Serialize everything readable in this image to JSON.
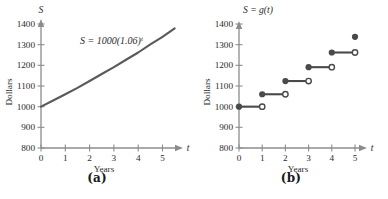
{
  "figure": {
    "background": "#ffffff",
    "axis_color": "#8c8c8c",
    "curve_color": "#5a5a5a",
    "text_color": "#2b2b2b"
  },
  "panels": [
    {
      "key": "a",
      "sub_label": "(a)",
      "title": "S",
      "equation_label": "S = 1000(1.06)",
      "equation_exponent": "t",
      "y_axis_label": "Dollars",
      "x_axis_label": "Years",
      "x_axis_symbol": "t",
      "y_ticks": [
        "800",
        "900",
        "1000",
        "1100",
        "1200",
        "1300",
        "1400"
      ],
      "x_ticks": [
        "0",
        "1",
        "2",
        "3",
        "4",
        "5"
      ]
    },
    {
      "key": "b",
      "sub_label": "(b)",
      "title": "S = g(t)",
      "title_plain": "S = ",
      "title_func": "g",
      "title_arg": "(t)",
      "y_axis_label": "Dollars",
      "x_axis_label": "Years",
      "x_axis_symbol": "t",
      "y_ticks": [
        "800",
        "900",
        "1000",
        "1100",
        "1200",
        "1300",
        "1400"
      ],
      "x_ticks": [
        "0",
        "1",
        "2",
        "3",
        "4",
        "5"
      ]
    }
  ],
  "chart_data": [
    {
      "type": "line",
      "panel": "a",
      "title": "S = 1000(1.06)^t",
      "xlabel": "Years",
      "ylabel": "Dollars",
      "xlim": [
        0,
        5.6
      ],
      "ylim": [
        800,
        1400
      ],
      "grid": false,
      "legend": "none",
      "formula": "S = 1000(1.06)^t",
      "series": [
        {
          "name": "S = 1000(1.06)^t",
          "color": "#5a5a5a",
          "x": [
            0,
            0.5,
            1,
            1.5,
            2,
            2.5,
            3,
            3.5,
            4,
            4.5,
            5,
            5.5
          ],
          "y": [
            1000,
            1030,
            1060,
            1091,
            1124,
            1158,
            1191,
            1227,
            1262,
            1301,
            1338,
            1379
          ]
        }
      ]
    },
    {
      "type": "line",
      "panel": "b",
      "title": "S = g(t)",
      "xlabel": "Years",
      "ylabel": "Dollars",
      "xlim": [
        0,
        5.6
      ],
      "ylim": [
        800,
        1400
      ],
      "grid": false,
      "legend": "none",
      "step_style": "left-closed-right-open",
      "steps": [
        {
          "x_start": 0,
          "x_end": 1,
          "value": 1000,
          "closed_left": true,
          "open_right": true
        },
        {
          "x_start": 1,
          "x_end": 2,
          "value": 1060,
          "closed_left": true,
          "open_right": true
        },
        {
          "x_start": 2,
          "x_end": 3,
          "value": 1124,
          "closed_left": true,
          "open_right": true
        },
        {
          "x_start": 3,
          "x_end": 4,
          "value": 1191,
          "closed_left": true,
          "open_right": true
        },
        {
          "x_start": 4,
          "x_end": 5,
          "value": 1262,
          "closed_left": true,
          "open_right": true
        },
        {
          "x_start": 5,
          "x_end": 5,
          "value": 1338,
          "closed_left": true,
          "open_right": false
        }
      ]
    }
  ]
}
